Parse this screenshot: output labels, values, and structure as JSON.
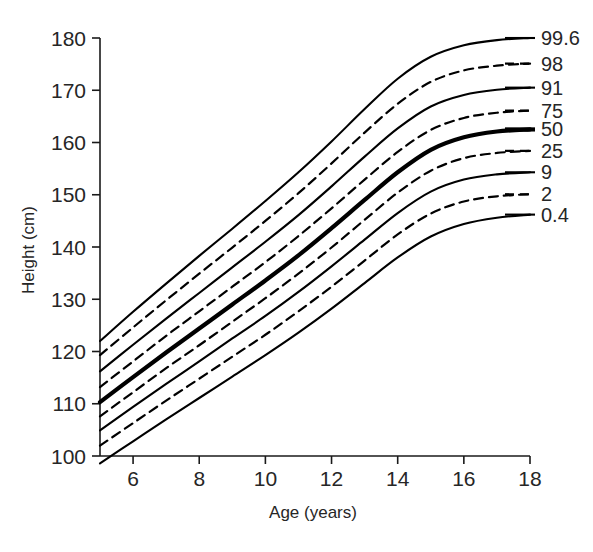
{
  "chart_data": {
    "type": "line",
    "title": "",
    "subtitle": "",
    "xlabel": "Age (years)",
    "ylabel": "Height (cm)",
    "xlim": [
      5,
      18
    ],
    "ylim": [
      95,
      182
    ],
    "grid": false,
    "legend_position": "right-of-plot-line-ends",
    "xticks": [
      6,
      8,
      10,
      12,
      14,
      16,
      18
    ],
    "xticklabels": [
      "6",
      "8",
      "10",
      "12",
      "14",
      "16",
      "18"
    ],
    "yticks": [
      100,
      110,
      120,
      130,
      140,
      150,
      160,
      170,
      180
    ],
    "yticklabels": [
      "100",
      "110",
      "120",
      "130",
      "140",
      "150",
      "160",
      "170",
      "180"
    ],
    "x": [
      5,
      6,
      7,
      8,
      9,
      10,
      11,
      12,
      13,
      14,
      15,
      16,
      17,
      18
    ],
    "series": [
      {
        "name": "99.6",
        "label": "99.6",
        "style": "solid",
        "emphasis": false,
        "values": [
          122.0,
          127.6,
          133.0,
          138.3,
          143.5,
          148.8,
          154.3,
          160.2,
          166.4,
          172.2,
          176.4,
          178.6,
          179.6,
          180.0
        ]
      },
      {
        "name": "98",
        "label": "98",
        "style": "dashed",
        "emphasis": false,
        "values": [
          119.3,
          124.6,
          129.8,
          134.9,
          139.9,
          145.0,
          150.3,
          156.0,
          161.9,
          167.4,
          171.6,
          173.8,
          174.7,
          175.1
        ]
      },
      {
        "name": "91",
        "label": "91",
        "style": "solid",
        "emphasis": false,
        "values": [
          116.2,
          121.3,
          126.3,
          131.2,
          136.1,
          141.0,
          146.1,
          151.6,
          157.3,
          162.7,
          166.9,
          169.1,
          170.1,
          170.5
        ]
      },
      {
        "name": "75",
        "label": "75",
        "style": "dashed",
        "emphasis": false,
        "values": [
          113.2,
          118.1,
          123.0,
          127.7,
          132.4,
          137.1,
          142.1,
          147.4,
          152.9,
          158.2,
          162.4,
          164.7,
          165.7,
          166.1
        ]
      },
      {
        "name": "50",
        "label": "50",
        "style": "solid",
        "emphasis": true,
        "values": [
          110.3,
          115.1,
          119.8,
          124.4,
          129.0,
          133.6,
          138.4,
          143.6,
          149.0,
          154.3,
          158.6,
          161.0,
          162.1,
          162.5
        ]
      },
      {
        "name": "25",
        "label": "25",
        "style": "dashed",
        "emphasis": false,
        "values": [
          107.6,
          112.2,
          116.8,
          121.2,
          125.7,
          130.2,
          134.9,
          139.9,
          145.2,
          150.4,
          154.6,
          157.0,
          158.0,
          158.4
        ]
      },
      {
        "name": "9",
        "label": "9",
        "style": "solid",
        "emphasis": false,
        "values": [
          104.9,
          109.4,
          113.8,
          118.1,
          122.5,
          126.8,
          131.4,
          136.3,
          141.4,
          146.5,
          150.6,
          152.9,
          153.9,
          154.3
        ]
      },
      {
        "name": "2",
        "label": "2",
        "style": "dashed",
        "emphasis": false,
        "values": [
          102.0,
          106.3,
          110.6,
          114.8,
          119.0,
          123.2,
          127.7,
          132.4,
          137.4,
          142.4,
          146.4,
          148.7,
          149.7,
          150.1
        ]
      },
      {
        "name": "0.4",
        "label": "0.4",
        "style": "solid",
        "emphasis": false,
        "values": [
          98.6,
          102.8,
          107.0,
          111.1,
          115.2,
          119.3,
          123.6,
          128.2,
          133.1,
          138.0,
          142.0,
          144.4,
          145.6,
          146.2
        ]
      }
    ]
  }
}
